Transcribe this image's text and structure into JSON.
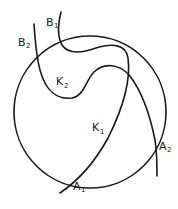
{
  "diagram": {
    "circle": {
      "cx": 90,
      "cy": 112,
      "r": 76
    },
    "curves": [
      {
        "name": "K1",
        "label": "K",
        "sub": "1"
      },
      {
        "name": "K2",
        "label": "K",
        "sub": "2"
      }
    ],
    "points": [
      {
        "name": "A1",
        "label": "A",
        "sub": "1"
      },
      {
        "name": "A2",
        "label": "A",
        "sub": "2"
      },
      {
        "name": "B1",
        "label": "B",
        "sub": "1"
      },
      {
        "name": "B2",
        "label": "B",
        "sub": "2"
      }
    ]
  }
}
